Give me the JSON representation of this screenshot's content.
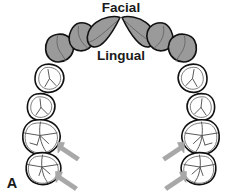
{
  "figure": {
    "panel_label": "A",
    "title_facial": "Facial",
    "title_lingual": "Lingual",
    "background_color": "#ffffff",
    "shaded_tooth_color": "#9a9a9a",
    "outline_color": "#111111",
    "arrow_color": "#a8a8a8"
  },
  "labels": {
    "facial": "Facial",
    "lingual": "Lingual",
    "panel": "A"
  },
  "teeth": {
    "anterior_shaded": [
      {
        "name": "canine-left",
        "type": "canine",
        "shaded": true
      },
      {
        "name": "lateral-incisor-left",
        "type": "lateral-incisor",
        "shaded": true
      },
      {
        "name": "central-incisor-left",
        "type": "central-incisor",
        "shaded": true
      },
      {
        "name": "central-incisor-right",
        "type": "central-incisor",
        "shaded": true
      },
      {
        "name": "lateral-incisor-right",
        "type": "lateral-incisor",
        "shaded": true
      },
      {
        "name": "canine-right",
        "type": "canine",
        "shaded": true
      }
    ],
    "posterior_left": [
      {
        "name": "first-premolar-left",
        "type": "premolar",
        "shaded": false
      },
      {
        "name": "second-premolar-left",
        "type": "premolar",
        "shaded": false
      },
      {
        "name": "first-molar-left",
        "type": "molar",
        "shaded": false,
        "arrow": true
      },
      {
        "name": "second-molar-left",
        "type": "molar",
        "shaded": false,
        "arrow": true
      }
    ],
    "posterior_right": [
      {
        "name": "first-premolar-right",
        "type": "premolar",
        "shaded": false
      },
      {
        "name": "second-premolar-right",
        "type": "premolar",
        "shaded": false
      },
      {
        "name": "first-molar-right",
        "type": "molar",
        "shaded": false,
        "arrow": true
      },
      {
        "name": "second-molar-right",
        "type": "molar",
        "shaded": false,
        "arrow": true
      }
    ]
  },
  "arrows": [
    {
      "name": "arrow-first-molar-left",
      "direction": "up-left",
      "target": "first-molar-left"
    },
    {
      "name": "arrow-second-molar-left",
      "direction": "up-left",
      "target": "second-molar-left"
    },
    {
      "name": "arrow-first-molar-right",
      "direction": "up-right",
      "target": "first-molar-right"
    },
    {
      "name": "arrow-second-molar-right",
      "direction": "up-right",
      "target": "second-molar-right"
    }
  ]
}
